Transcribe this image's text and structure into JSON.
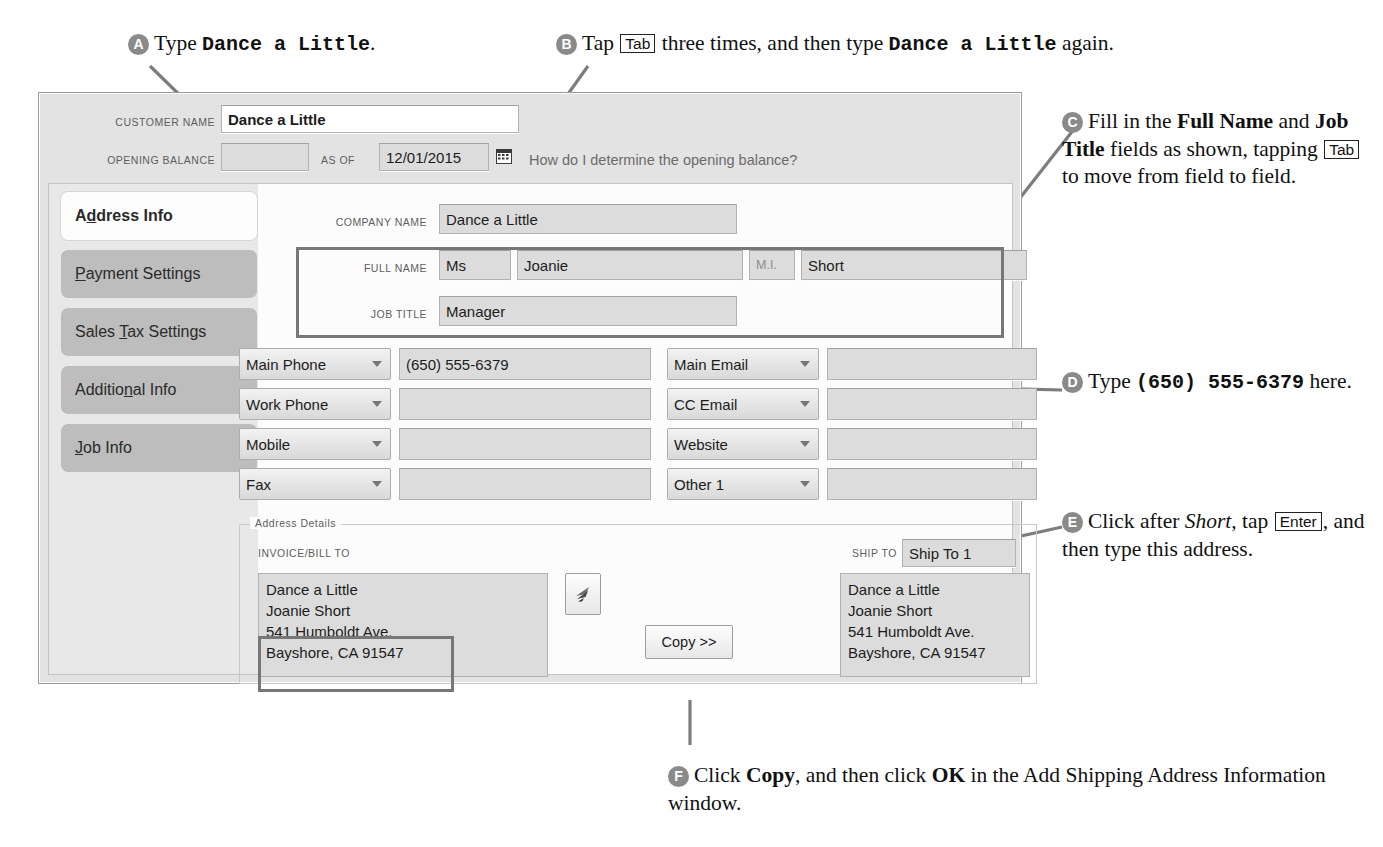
{
  "callouts": [
    {
      "id": "A",
      "letter": "A",
      "text_parts": [
        {
          "t": "Type ",
          "s": "n"
        },
        {
          "t": "Dance a Little",
          "s": "m"
        },
        {
          "t": ".",
          "s": "n"
        }
      ]
    },
    {
      "id": "B",
      "letter": "B",
      "text_parts": [
        {
          "t": "Tap ",
          "s": "n"
        },
        {
          "t": "Tab",
          "s": "k"
        },
        {
          "t": " three times, and then type ",
          "s": "n"
        },
        {
          "t": "Dance a Little",
          "s": "m"
        },
        {
          "t": " again.",
          "s": "n"
        }
      ]
    },
    {
      "id": "C",
      "letter": "C",
      "text_parts": [
        {
          "t": "Fill in the ",
          "s": "n"
        },
        {
          "t": "Full Name",
          "s": "b"
        },
        {
          "t": " and ",
          "s": "n"
        },
        {
          "t": "Job Title",
          "s": "b"
        },
        {
          "t": " fields as shown, tapping ",
          "s": "n"
        },
        {
          "t": "Tab",
          "s": "k"
        },
        {
          "t": " to move from field to field.",
          "s": "n"
        }
      ]
    },
    {
      "id": "D",
      "letter": "D",
      "text_parts": [
        {
          "t": "Type ",
          "s": "n"
        },
        {
          "t": "(650) 555-6379",
          "s": "m"
        },
        {
          "t": " here.",
          "s": "n"
        }
      ]
    },
    {
      "id": "E",
      "letter": "E",
      "text_parts": [
        {
          "t": "Click after ",
          "s": "n"
        },
        {
          "t": "Short,",
          "s": "i"
        },
        {
          "t": " tap ",
          "s": "n"
        },
        {
          "t": "Enter",
          "s": "k"
        },
        {
          "t": ", and then type this address.",
          "s": "n"
        }
      ]
    },
    {
      "id": "F",
      "letter": "F",
      "text_parts": [
        {
          "t": "Click ",
          "s": "n"
        },
        {
          "t": "Copy",
          "s": "b"
        },
        {
          "t": ", and then click ",
          "s": "n"
        },
        {
          "t": "OK",
          "s": "b"
        },
        {
          "t": " in the Add Shipping Address Information window.",
          "s": "n"
        }
      ]
    }
  ],
  "window": {
    "header": {
      "customer_name_label": "Customer Name",
      "customer_name_value": "Dance a Little",
      "opening_balance_label": "Opening Balance",
      "opening_balance_value": "",
      "as_of_label": "as of",
      "as_of_value": "12/01/2015",
      "calendar_icon": "calendar-icon",
      "help_link": "How do I determine the opening balance?"
    },
    "tabs": [
      {
        "label": "Address Info",
        "accel": 1,
        "active": true
      },
      {
        "label": "Payment Settings",
        "accel": 0,
        "active": false
      },
      {
        "label": "Sales Tax Settings",
        "accel": 6,
        "active": false
      },
      {
        "label": "Additional Info",
        "accel": 9,
        "active": false
      },
      {
        "label": "Job Info",
        "accel": 0,
        "active": false
      }
    ],
    "fields": {
      "company_name_label": "Company Name",
      "company_name_value": "Dance a Little",
      "full_name_label": "Full Name",
      "salutation_value": "Ms",
      "first_name_value": "Joanie",
      "mi_label": "M.I.",
      "mi_value": "",
      "last_name_value": "Short",
      "job_title_label": "Job Title",
      "job_title_value": "Manager"
    },
    "contact_rows": [
      {
        "left_label": "Main Phone",
        "left_value": "(650) 555-6379",
        "right_label": "Main Email",
        "right_value": ""
      },
      {
        "left_label": "Work Phone",
        "left_value": "",
        "right_label": "CC Email",
        "right_value": ""
      },
      {
        "left_label": "Mobile",
        "left_value": "",
        "right_label": "Website",
        "right_value": ""
      },
      {
        "left_label": "Fax",
        "left_value": "",
        "right_label": "Other 1",
        "right_value": ""
      }
    ],
    "address_details": {
      "group_title": "Address Details",
      "invoice_bill_to_label": "Invoice/Bill To",
      "invoice_bill_to_lines": [
        "Dance a Little",
        "Joanie Short",
        "541 Humboldt Ave.",
        "Bayshore, CA 91547"
      ],
      "edit_icon": "edit-address-icon",
      "copy_button": "Copy >>",
      "ship_to_label": "Ship To",
      "ship_to_selector": "Ship To 1",
      "ship_to_lines": [
        "Dance a Little",
        "Joanie Short",
        "541 Humboldt Ave.",
        "Bayshore, CA 91547"
      ]
    }
  },
  "colors": {
    "bullet": "#8a8a8a",
    "leader": "#7d7d7d",
    "window_bg": "#e3e3e3",
    "tab_inactive": "#bdbdbd",
    "tab_active": "#fdfdfd",
    "field_bg": "#dcdcdc",
    "highlight_border": "#777777"
  }
}
